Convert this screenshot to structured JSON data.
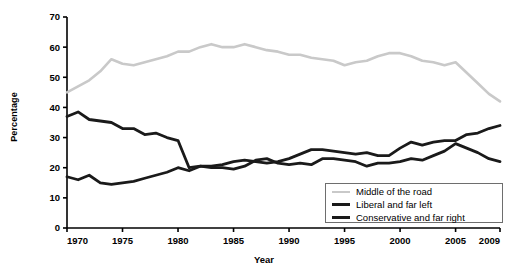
{
  "chart_data": {
    "type": "line",
    "title": "",
    "xlabel": "Year",
    "ylabel": "Percentage",
    "xlim": [
      1970,
      2009
    ],
    "ylim": [
      0,
      70
    ],
    "grid": false,
    "legend_position": "bottom-right",
    "xticks": [
      "1970",
      "1975",
      "1980",
      "1985",
      "1990",
      "1995",
      "2000",
      "2005",
      "2009"
    ],
    "xtick_values": [
      1970,
      1975,
      1980,
      1985,
      1990,
      1995,
      2000,
      2005,
      2009
    ],
    "yticks": [
      "0",
      "10",
      "20",
      "30",
      "40",
      "50",
      "60",
      "70"
    ],
    "ytick_values": [
      0,
      10,
      20,
      30,
      40,
      50,
      60,
      70
    ],
    "x": [
      1970,
      1971,
      1972,
      1973,
      1974,
      1975,
      1976,
      1977,
      1978,
      1979,
      1980,
      1981,
      1982,
      1983,
      1984,
      1985,
      1986,
      1987,
      1988,
      1989,
      1990,
      1991,
      1992,
      1993,
      1994,
      1995,
      1996,
      1997,
      1998,
      1999,
      2000,
      2001,
      2002,
      2003,
      2004,
      2005,
      2006,
      2007,
      2008,
      2009
    ],
    "series": [
      {
        "name": "Middle of the road",
        "color": "#c9c9c9",
        "width": 2.6,
        "values": [
          45.0,
          47.0,
          49.0,
          52.0,
          56.0,
          54.5,
          54.0,
          55.0,
          56.0,
          57.0,
          58.5,
          58.5,
          60.0,
          61.0,
          60.0,
          60.0,
          61.0,
          60.0,
          59.0,
          58.5,
          57.5,
          57.5,
          56.5,
          56.0,
          55.5,
          54.0,
          55.0,
          55.5,
          57.0,
          58.0,
          58.0,
          57.0,
          55.5,
          55.0,
          54.0,
          55.0,
          51.5,
          48.0,
          44.5,
          42.0
        ]
      },
      {
        "name": "Liberal and far left",
        "color": "#1a1a1a",
        "width": 2.8,
        "values": [
          17.0,
          16.0,
          17.5,
          15.0,
          14.5,
          15.0,
          15.5,
          16.5,
          17.5,
          18.5,
          20.0,
          19.0,
          20.5,
          20.5,
          21.0,
          22.0,
          22.5,
          22.0,
          21.5,
          22.0,
          23.0,
          24.5,
          26.0,
          26.0,
          25.5,
          25.0,
          24.5,
          25.0,
          24.0,
          24.0,
          26.5,
          28.5,
          27.5,
          28.5,
          29.0,
          29.0,
          31.0,
          31.5,
          33.0,
          34.0
        ]
      },
      {
        "name": "Conservative and far right",
        "color": "#1a1a1a",
        "width": 2.8,
        "values": [
          37.0,
          38.5,
          36.0,
          35.5,
          35.0,
          33.0,
          33.0,
          31.0,
          31.5,
          30.0,
          29.0,
          20.0,
          20.5,
          20.0,
          20.0,
          19.5,
          20.5,
          22.5,
          23.0,
          21.5,
          21.0,
          21.5,
          21.0,
          23.0,
          23.0,
          22.5,
          22.0,
          20.5,
          21.5,
          21.5,
          22.0,
          23.0,
          22.5,
          24.0,
          25.5,
          28.0,
          26.5,
          25.0,
          23.0,
          22.0
        ]
      }
    ],
    "legend": [
      {
        "label": "Middle of the road",
        "color": "#c9c9c9",
        "width": 2.6
      },
      {
        "label": "Liberal and far left",
        "color": "#1a1a1a",
        "width": 3.2
      },
      {
        "label": "Conservative and far right",
        "color": "#1a1a1a",
        "width": 3.2
      }
    ],
    "axis_color": "#000000"
  }
}
